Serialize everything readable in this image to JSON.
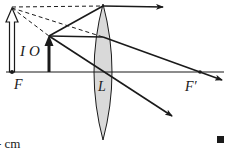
{
  "diagram": {
    "type": "optics-ray-diagram",
    "colors": {
      "ink": "#1a1a1a",
      "lens_fill": "#d9d9d9",
      "background": "#ffffff"
    },
    "labels": {
      "image": "I",
      "object": "O",
      "focus_left": "F",
      "lens": "L",
      "focus_right": "F′",
      "unit_fragment": "- cm",
      "end_mark": "■"
    },
    "geometry": {
      "axis": {
        "y": 72,
        "x1": 6,
        "x2": 224
      },
      "lens": {
        "cx": 103,
        "top": 4,
        "bottom": 140,
        "half_width": 9
      },
      "focus_left_x": 12,
      "focus_right_x": 200,
      "object": {
        "x": 49,
        "base_y": 72,
        "tip_y": 36
      },
      "image": {
        "x": 12,
        "base_y": 72,
        "tip_y": 8
      }
    }
  }
}
